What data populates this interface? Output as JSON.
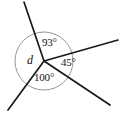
{
  "figure": {
    "type": "angle-diagram",
    "background_color": "#ffffff",
    "line_color": "#1a1a1a",
    "circle_color": "#8a8a8a",
    "vertex": {
      "x": 44,
      "y": 61
    },
    "circle": {
      "cx": 44,
      "cy": 61,
      "r": 29
    },
    "vertex_label": "d",
    "vertex_label_pos": {
      "x": 27,
      "y": 54
    },
    "rays": [
      {
        "name": "ray-up-left",
        "x1": 44,
        "y1": 61,
        "x2": 24,
        "y2": 2
      },
      {
        "name": "ray-right",
        "x1": 44,
        "y1": 61,
        "x2": 118,
        "y2": 40
      },
      {
        "name": "ray-down-right",
        "x1": 44,
        "y1": 61,
        "x2": 110,
        "y2": 105
      },
      {
        "name": "ray-down-left",
        "x1": 44,
        "y1": 61,
        "x2": 8,
        "y2": 110
      }
    ],
    "angles": [
      {
        "name": "angle-93",
        "label": "93°",
        "value": 93,
        "x": 42,
        "y": 37
      },
      {
        "name": "angle-45",
        "label": "45°",
        "value": 45,
        "x": 61,
        "y": 57
      },
      {
        "name": "angle-100",
        "label": "100°",
        "value": 100,
        "x": 34,
        "y": 72
      },
      {
        "name": "angle-d",
        "label": "d",
        "value": null,
        "x": 27,
        "y": 54
      }
    ]
  },
  "chart_data": {
    "type": "pie",
    "title": "",
    "subtitle": "",
    "xlabel": "",
    "ylabel": "",
    "legend_position": "none",
    "grid": false,
    "categories": [
      "d",
      "93°",
      "45°",
      "100°"
    ],
    "values": [
      122,
      93,
      45,
      100
    ],
    "annotations": [
      "93°",
      "45°",
      "100°",
      "d"
    ],
    "note": "Four rays meet at a common vertex; three angles are labeled 93°, 45° and 100°, the fourth is the unknown d."
  }
}
